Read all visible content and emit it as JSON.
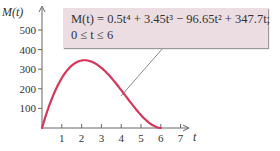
{
  "chart_data": {
    "type": "line",
    "title": "",
    "xlabel": "t",
    "ylabel": "M(t)",
    "xlim": [
      0,
      7.4
    ],
    "ylim": [
      0,
      560
    ],
    "x_ticks": [
      1,
      2,
      3,
      4,
      5,
      6,
      7
    ],
    "y_ticks": [
      100,
      200,
      300,
      400,
      500
    ],
    "grid": false,
    "series": [
      {
        "name": "M(t) = 0.5t^4 + 3.45t^3 - 96.65t^2 + 347.7t",
        "color": "#d9345a",
        "x": [
          0,
          0.5,
          1,
          1.5,
          2,
          2.5,
          3,
          3.5,
          4,
          4.5,
          5,
          5.5,
          6
        ],
        "values": [
          0,
          150.6,
          255.0,
          315.1,
          335.8,
          322.8,
          284.3,
          229.0,
          166.8,
          106.4,
          55.0,
          18.9,
          1.2
        ]
      }
    ],
    "annotations": [
      {
        "text_line1": "M(t) = 0.5t⁴ + 3.45t³ − 96.65t² + 347.7t;",
        "text_line2": "0 ≤ t ≤ 6",
        "points_to": {
          "t": 4.1,
          "M": 160
        }
      }
    ]
  },
  "callout": {
    "line1": "M(t) = 0.5t⁴ + 3.45t³ − 96.65t² + 347.7t;",
    "line2": "0 ≤ t ≤ 6"
  },
  "axes": {
    "x_title": "t",
    "y_title": "M(t)",
    "x_tick_labels": [
      "1",
      "2",
      "3",
      "4",
      "5",
      "6",
      "7"
    ],
    "y_tick_labels": [
      "100",
      "200",
      "300",
      "400",
      "500"
    ]
  }
}
